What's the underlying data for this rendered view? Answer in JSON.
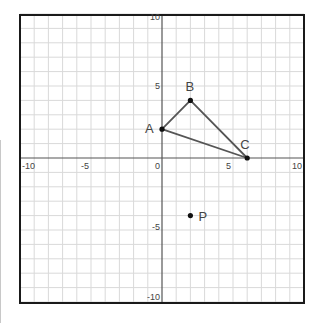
{
  "diagram": {
    "type": "coordinate-plane",
    "x_range": [
      -10,
      10
    ],
    "y_range": [
      -10,
      10
    ],
    "grid_step": 1,
    "tick_labels": {
      "x": [
        {
          "value": -10,
          "label": "-10"
        },
        {
          "value": -5,
          "label": "-5"
        },
        {
          "value": 0,
          "label": "0"
        },
        {
          "value": 5,
          "label": "5"
        },
        {
          "value": 10,
          "label": "10"
        }
      ],
      "y": [
        {
          "value": 10,
          "label": "10"
        },
        {
          "value": 5,
          "label": "5"
        },
        {
          "value": -5,
          "label": "-5"
        },
        {
          "value": -10,
          "label": "-10"
        }
      ]
    },
    "points": [
      {
        "name": "A",
        "x": 0,
        "y": 2
      },
      {
        "name": "B",
        "x": 2,
        "y": 4
      },
      {
        "name": "C",
        "x": 6,
        "y": 0
      },
      {
        "name": "P",
        "x": 2,
        "y": -4
      }
    ],
    "triangle": [
      "A",
      "B",
      "C"
    ],
    "colors": {
      "grid": "#d9d9d9",
      "axis": "#555555",
      "frame": "#1a1a1a",
      "segment": "#555555",
      "point": "#111111",
      "label": "#444444"
    }
  }
}
